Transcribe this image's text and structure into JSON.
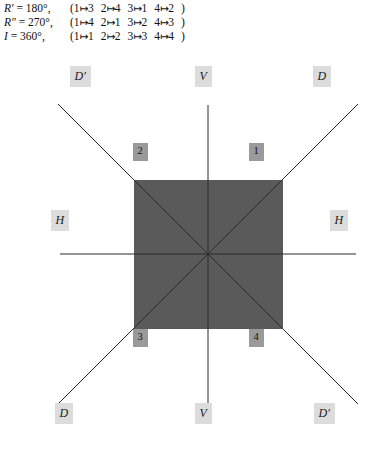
{
  "equations": [
    {
      "symbol": "R′",
      "equals": "=",
      "angle": "180°",
      "comma": ",",
      "open": "(",
      "maps": [
        {
          "from": "1",
          "to": "3"
        },
        {
          "from": "2",
          "to": "4"
        },
        {
          "from": "3",
          "to": "1"
        },
        {
          "from": "4",
          "to": "2"
        }
      ],
      "close": ")"
    },
    {
      "symbol": "R″",
      "equals": "=",
      "angle": "270°",
      "comma": ",",
      "open": "(",
      "maps": [
        {
          "from": "1",
          "to": "4"
        },
        {
          "from": "2",
          "to": "1"
        },
        {
          "from": "3",
          "to": "2"
        },
        {
          "from": "4",
          "to": "3"
        }
      ],
      "close": ")"
    },
    {
      "symbol": "I",
      "equals": "=",
      "angle": "360°",
      "comma": ",",
      "open": "(",
      "maps": [
        {
          "from": "1",
          "to": "1"
        },
        {
          "from": "2",
          "to": "2"
        },
        {
          "from": "3",
          "to": "3"
        },
        {
          "from": "4",
          "to": "4"
        }
      ],
      "close": ")"
    }
  ],
  "arrow_glyph": "↦",
  "diagram": {
    "axis_labels": [
      {
        "id": "d-prime-top-left",
        "text": "D′",
        "x": 80,
        "y": 76
      },
      {
        "id": "v-top",
        "text": "V",
        "x": 203,
        "y": 76
      },
      {
        "id": "d-top-right",
        "text": "D",
        "x": 322,
        "y": 76
      },
      {
        "id": "h-left",
        "text": "H",
        "x": 60,
        "y": 220
      },
      {
        "id": "h-right",
        "text": "H",
        "x": 339,
        "y": 220
      },
      {
        "id": "d-bottom-left",
        "text": "D",
        "x": 64,
        "y": 413
      },
      {
        "id": "v-bottom",
        "text": "V",
        "x": 203,
        "y": 413
      },
      {
        "id": "d-prime-bottom-right",
        "text": "D′",
        "x": 324,
        "y": 413
      }
    ],
    "corner_labels": [
      {
        "id": "corner-1",
        "text": "1",
        "x": 256,
        "y": 152
      },
      {
        "id": "corner-2",
        "text": "2",
        "x": 140,
        "y": 152
      },
      {
        "id": "corner-3",
        "text": "3",
        "x": 140,
        "y": 338
      },
      {
        "id": "corner-4",
        "text": "4",
        "x": 256,
        "y": 338
      }
    ],
    "square": {
      "x": 134,
      "y": 180,
      "size": 149,
      "fill": "#5a5a5a"
    },
    "center": {
      "x": 208,
      "y": 254
    },
    "axes": [
      {
        "id": "axis-vertical-V",
        "x1": 208,
        "y1": 105,
        "x2": 208,
        "y2": 403
      },
      {
        "id": "axis-horizontal-H",
        "x1": 60,
        "y1": 254,
        "x2": 356,
        "y2": 254
      },
      {
        "id": "axis-diagonal-D",
        "x1": 58,
        "y1": 404,
        "x2": 358,
        "y2": 104
      },
      {
        "id": "axis-diagonal-D-prime",
        "x1": 58,
        "y1": 104,
        "x2": 358,
        "y2": 404
      }
    ],
    "line_color": "#2b2b2b",
    "chip_color": "#dcdcdc",
    "corner_chip_color": "#9a9a9a"
  }
}
